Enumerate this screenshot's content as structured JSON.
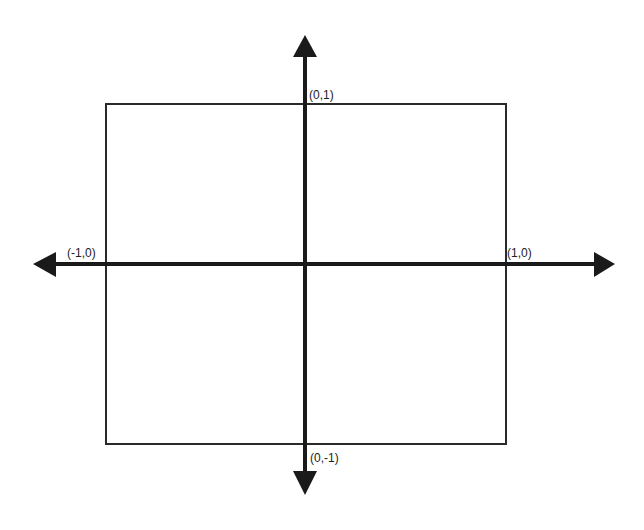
{
  "diagram": {
    "type": "coordinate-axes-with-square",
    "colors": {
      "background": "#ffffff",
      "axis": "#1a1a1a",
      "square": "#2a2a2a",
      "label": "#222222"
    },
    "square": {
      "x1": 106,
      "y1": 104,
      "x2": 506,
      "y2": 444
    },
    "axes": {
      "origin": {
        "x": 305,
        "y": 264
      },
      "horizontal": {
        "x_start": 33,
        "x_end": 615
      },
      "vertical": {
        "y_start": 35,
        "y_end": 495
      }
    },
    "labels": {
      "top": "(0,1)",
      "bottom": "(0,-1)",
      "left": "(-1,0)",
      "right": "(1,0)"
    }
  }
}
